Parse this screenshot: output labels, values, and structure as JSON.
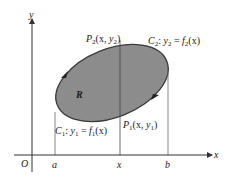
{
  "figure": {
    "type": "region-between-two-curves",
    "colors": {
      "region_fill": "#8c8c8c",
      "region_stroke": "#3a3a3a",
      "axis": "#333333",
      "guide_lines": "#555555",
      "background": "#ffffff"
    },
    "axes": {
      "x_label": "x",
      "y_label": "y",
      "origin_label": "O"
    },
    "x_ticks": [
      {
        "label": "a"
      },
      {
        "label": "x"
      },
      {
        "label": "b"
      }
    ],
    "region": {
      "label": "R",
      "orientation": "counterclockwise"
    },
    "points": {
      "p2": {
        "name": "P",
        "sub": "2",
        "coords_prefix": "(x, ",
        "coord_var": "y",
        "coord_sub": "2",
        "coords_suffix": ")"
      },
      "p1": {
        "name": "P",
        "sub": "1",
        "coords_prefix": "(x, ",
        "coord_var": "y",
        "coord_sub": "1",
        "coords_suffix": ")"
      }
    },
    "curves": {
      "c2": {
        "name": "C",
        "sub": "2",
        "sep": ": ",
        "lhs_var": "y",
        "lhs_sub": "2",
        "eq": " = ",
        "fn": "f",
        "fn_sub": "2",
        "arg": "(x)"
      },
      "c1": {
        "name": "C",
        "sub": "1",
        "sep": ": ",
        "lhs_var": "y",
        "lhs_sub": "1",
        "eq": " = ",
        "fn": "f",
        "fn_sub": "1",
        "arg": "(x)"
      }
    }
  }
}
